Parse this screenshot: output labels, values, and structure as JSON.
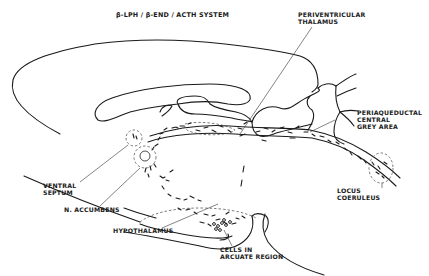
{
  "title": "β-LPH / β-END / ACTH SYSTEM",
  "labels": {
    "periventricular_thalamus": [
      "PERIVENTRICULAR",
      "THALAMUS"
    ],
    "periaqueductal": [
      "PERIAQUEDUCTAL",
      "CENTRAL",
      "GREY AREA"
    ],
    "ventral_septum": [
      "VENTRAL",
      "SEPTUM"
    ],
    "n_accumbens": "N. ACCUMBENS",
    "hypothalamus": "HYPOTHALAMUS",
    "arcuate": [
      "CELLS IN",
      "ARCUATE REGION"
    ],
    "locus_coeruleus": [
      "LOCUS",
      "COERULEUS"
    ]
  },
  "colors": {
    "line": "#1a1a1a",
    "background": "#ffffff"
  }
}
